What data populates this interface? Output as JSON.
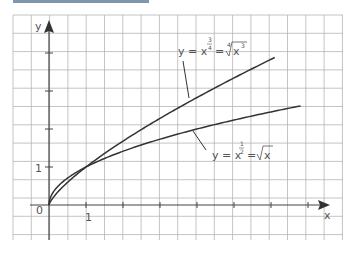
{
  "header": {
    "bar_color": "#7f97ae"
  },
  "chart_data": {
    "type": "line",
    "title": "",
    "xlabel": "x",
    "ylabel": "y",
    "grid": true,
    "x_tick_labels": [
      "1"
    ],
    "y_tick_labels": [
      "1"
    ],
    "origin_label": "0",
    "xlim": [
      -1,
      7.5
    ],
    "ylim": [
      -1,
      5
    ],
    "series": [
      {
        "name": "y = x^(3/4) = ⁴√(x³)",
        "label_parts": {
          "lhs": "y = x",
          "exp_num": "3",
          "exp_den": "4",
          "eq": "=",
          "root_index": "4",
          "radicand": "x",
          "radicand_exp": "3"
        },
        "x": [
          0,
          0.25,
          0.5,
          1,
          2,
          3,
          4,
          5,
          6.1
        ],
        "values": [
          0,
          0.354,
          0.595,
          1,
          1.682,
          2.28,
          2.828,
          3.344,
          3.88
        ]
      },
      {
        "name": "y = x^(1/2) = √x",
        "label_parts": {
          "lhs": "y = x",
          "exp_num": "1",
          "exp_den": "2",
          "eq": "=",
          "radicand": "x"
        },
        "x": [
          0,
          0.25,
          0.5,
          1,
          2,
          3,
          4,
          5,
          6.8
        ],
        "values": [
          0,
          0.5,
          0.707,
          1,
          1.414,
          1.732,
          2,
          2.236,
          2.608
        ]
      }
    ]
  }
}
